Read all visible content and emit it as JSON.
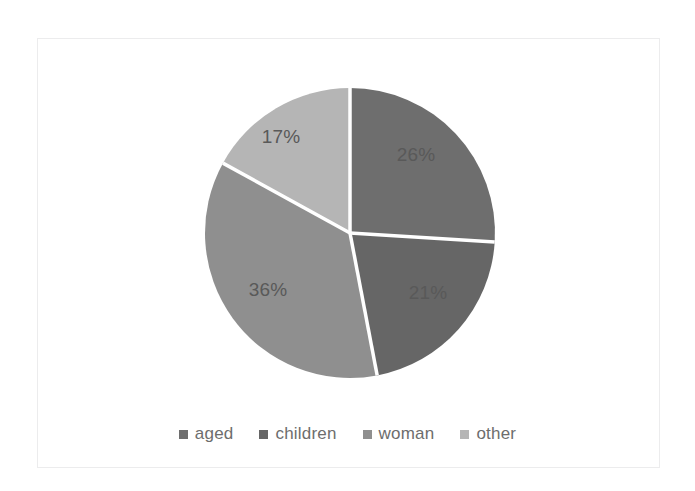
{
  "chart_data": {
    "type": "pie",
    "title": "",
    "categories": [
      "aged",
      "children",
      "woman",
      "other"
    ],
    "values": [
      26,
      21,
      36,
      17
    ],
    "value_labels": [
      "26%",
      "21%",
      "36%",
      "17%"
    ],
    "unit": "%",
    "colors": [
      "#6e6e6e",
      "#666666",
      "#8f8f8f",
      "#b5b5b5"
    ],
    "slice_label_color": "#595959",
    "separator_color": "#ffffff",
    "start_angle_deg": 0,
    "direction": "clockwise",
    "legend_position": "bottom",
    "grid": false,
    "xlabel": "",
    "ylabel": "",
    "slices": [
      {
        "name": "aged",
        "value": 26,
        "label": "26%",
        "color": "#6e6e6e",
        "label_x": 416,
        "label_y": 155
      },
      {
        "name": "children",
        "value": 21,
        "label": "21%",
        "color": "#666666",
        "label_x": 428,
        "label_y": 293
      },
      {
        "name": "woman",
        "value": 36,
        "label": "36%",
        "color": "#8f8f8f",
        "label_x": 268,
        "label_y": 290
      },
      {
        "name": "other",
        "value": 17,
        "label": "17%",
        "color": "#b5b5b5",
        "label_x": 281,
        "label_y": 137
      }
    ]
  },
  "legend": {
    "items": [
      {
        "label": "aged",
        "color": "#6e6e6e"
      },
      {
        "label": "children",
        "color": "#666666"
      },
      {
        "label": "woman",
        "color": "#8f8f8f"
      },
      {
        "label": "other",
        "color": "#b5b5b5"
      }
    ]
  },
  "frame": {
    "border_color": "#ececed",
    "background": "#ffffff"
  }
}
